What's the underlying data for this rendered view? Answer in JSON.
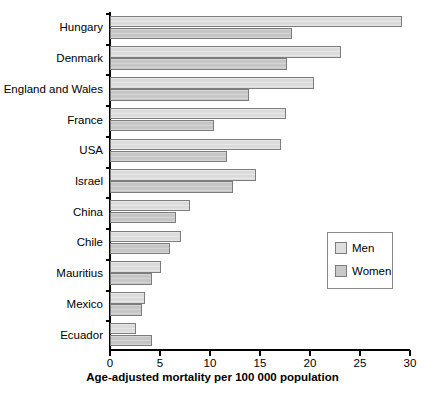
{
  "chart_data": {
    "type": "bar",
    "orientation": "horizontal",
    "title": "",
    "xlabel": "Age-adjusted mortality per 100 000 population",
    "ylabel": "",
    "xlim": [
      0,
      30
    ],
    "xticks": [
      0,
      5,
      10,
      15,
      20,
      25,
      30
    ],
    "xtick_labels": [
      "0",
      "5",
      "10",
      "15",
      "20",
      "25",
      "30"
    ],
    "grid": false,
    "legend_position": "center-right",
    "categories": [
      "Hungary",
      "Denmark",
      "England and Wales",
      "France",
      "USA",
      "Israel",
      "China",
      "Chile",
      "Mauritius",
      "Mexico",
      "Ecuador"
    ],
    "series": [
      {
        "name": "Men",
        "color": "#dedede",
        "values": [
          29.2,
          23.1,
          20.4,
          17.6,
          17.1,
          14.6,
          8.0,
          7.1,
          5.1,
          3.5,
          2.6
        ]
      },
      {
        "name": "Women",
        "color": "#c9c9c9",
        "values": [
          18.2,
          17.7,
          13.9,
          10.4,
          11.7,
          12.3,
          6.6,
          6.0,
          4.2,
          3.2,
          4.2
        ]
      }
    ]
  },
  "legend": {
    "items": [
      {
        "label": "Men",
        "color": "#dedede"
      },
      {
        "label": "Women",
        "color": "#c9c9c9"
      }
    ]
  },
  "axis": {
    "x_title": "Age-adjusted mortality per 100 000 population"
  }
}
